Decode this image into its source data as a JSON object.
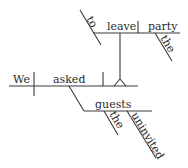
{
  "diagram": {
    "type": "Reed-Kellogg sentence diagram",
    "sentence_words": [
      "We",
      "asked",
      "the",
      "uninvited",
      "guests",
      "to",
      "leave",
      "the",
      "party"
    ],
    "colors": {
      "line": "#3a3a3a",
      "text": "#2a2a2a",
      "background": "#ffffff"
    },
    "main_clause": {
      "subject": "We",
      "verb": "asked"
    },
    "object": {
      "word": "guests",
      "modifiers": [
        "the",
        "uninvited"
      ]
    },
    "infinitive_phrase": {
      "marker": "to",
      "verb": "leave",
      "object": "party",
      "object_modifier": "the"
    }
  }
}
